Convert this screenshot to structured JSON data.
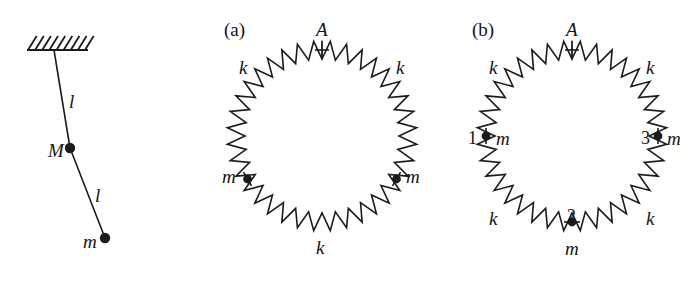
{
  "figure": {
    "width": 693,
    "height": 285,
    "background": "#ffffff",
    "ink": "#1b1b1b"
  },
  "pendulum": {
    "name": "double-pendulum",
    "support": {
      "label": "hatched-ceiling",
      "bar_x1": 27,
      "bar_x2": 88,
      "bar_y": 50,
      "hatch_count": 9,
      "hatch_height": 14
    },
    "pivot": {
      "x": 54,
      "y": 50
    },
    "joint": {
      "x": 70,
      "y": 148,
      "label": "M",
      "radius": 5.2
    },
    "bob": {
      "x": 105,
      "y": 238,
      "label": "m",
      "radius": 5.2
    },
    "rods": [
      {
        "label": "l",
        "label_x": 69,
        "label_y": 92
      },
      {
        "label": "l",
        "label_x": 95,
        "label_y": 186
      }
    ],
    "joint_label_pos": {
      "x": 48,
      "y": 141
    },
    "bob_label_pos": {
      "x": 83,
      "y": 232
    }
  },
  "ring_a": {
    "panel_label": "(a)",
    "panel_label_pos": {
      "x": 224,
      "y": 20
    },
    "center": {
      "x": 322,
      "y": 136
    },
    "radius": 86,
    "teeth": 36,
    "amplitude": 9,
    "fixed_point": {
      "label": "A",
      "angle_deg": 90,
      "label_x": 316,
      "label_y": 20,
      "tick_length": 17
    },
    "masses": [
      {
        "label": "m",
        "angle_deg": 210,
        "label_x": 222,
        "label_y": 167,
        "number": ""
      },
      {
        "label": "m",
        "angle_deg": 330,
        "label_x": 406,
        "label_y": 167,
        "number": ""
      }
    ],
    "springs": [
      {
        "label": "k",
        "label_x": 239,
        "label_y": 58
      },
      {
        "label": "k",
        "label_x": 396,
        "label_y": 58
      },
      {
        "label": "k",
        "label_x": 316,
        "label_y": 238
      }
    ]
  },
  "ring_b": {
    "panel_label": "(b)",
    "panel_label_pos": {
      "x": 472,
      "y": 20
    },
    "center": {
      "x": 572,
      "y": 136
    },
    "radius": 86,
    "teeth": 36,
    "amplitude": 9,
    "fixed_point": {
      "label": "A",
      "angle_deg": 90,
      "label_x": 566,
      "label_y": 20,
      "tick_length": 17
    },
    "masses": [
      {
        "number": "1",
        "label": "m",
        "angle_deg": 180,
        "num_x": 468,
        "num_y": 129,
        "label_x": 496,
        "label_y": 129
      },
      {
        "number": "2",
        "label": "m",
        "angle_deg": 270,
        "num_x": 567,
        "num_y": 207,
        "label_x": 565,
        "label_y": 239
      },
      {
        "number": "3",
        "label": "m",
        "angle_deg": 0,
        "num_x": 641,
        "num_y": 129,
        "label_x": 667,
        "label_y": 129
      }
    ],
    "springs": [
      {
        "label": "k",
        "label_x": 489,
        "label_y": 58
      },
      {
        "label": "k",
        "label_x": 646,
        "label_y": 58
      },
      {
        "label": "k",
        "label_x": 489,
        "label_y": 209
      },
      {
        "label": "k",
        "label_x": 646,
        "label_y": 209
      }
    ]
  }
}
